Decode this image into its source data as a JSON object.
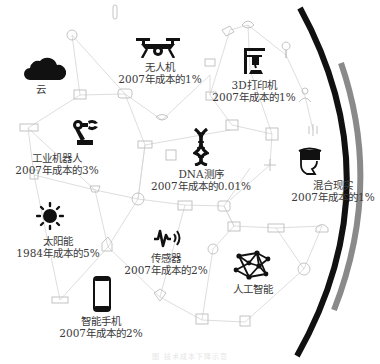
{
  "nodes": [
    {
      "id": "cloud",
      "name": "云",
      "cost": ""
    },
    {
      "id": "drone",
      "name": "无人机",
      "cost": "2007年成本的1%"
    },
    {
      "id": "printer3d",
      "name": "3D打印机",
      "cost": "2007年成本的1%"
    },
    {
      "id": "robot",
      "name": "工业机器人",
      "cost": "2007年成本的3%"
    },
    {
      "id": "dna",
      "name": "DNA测序",
      "cost": "2007年成本的0.01%"
    },
    {
      "id": "mixed-reality",
      "name": "混合现实",
      "cost": "2007年成本的1%"
    },
    {
      "id": "solar",
      "name": "太阳能",
      "cost": "1984年成本的5%"
    },
    {
      "id": "sensor",
      "name": "传感器",
      "cost": "2007年成本的2%"
    },
    {
      "id": "ai",
      "name": "人工智能",
      "cost": ""
    },
    {
      "id": "smartphone",
      "name": "智能手机",
      "cost": "2007年成本的2%"
    }
  ],
  "caption": "图 技术成本下降示意",
  "colors": {
    "icon": "#111111",
    "network": "#cfcfcf",
    "arc_black": "#111111",
    "arc_gray": "#8a8a8a",
    "text": "#3a3a3a"
  }
}
